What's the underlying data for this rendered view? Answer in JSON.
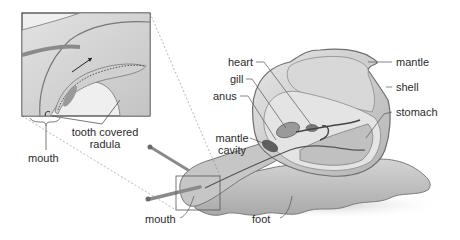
{
  "diagram": {
    "labels": {
      "heart": "heart",
      "gill": "gill",
      "anus": "anus",
      "mantle_cavity_line1": "mantle",
      "mantle_cavity_line2": "cavity",
      "mantle": "mantle",
      "shell": "shell",
      "stomach": "stomach",
      "foot": "foot",
      "mouth_main": "mouth",
      "mouth_inset": "mouth",
      "radula_line1": "tooth covered",
      "radula_line2": "radula"
    },
    "colors": {
      "label_text": "#2b2b2b",
      "leader_line": "#555555",
      "shell_fill": "#c9c9c9",
      "body_fill": "#bdbdbd",
      "organ_dark": "#6e6e6e",
      "inset_border": "#3a3a3a"
    }
  }
}
